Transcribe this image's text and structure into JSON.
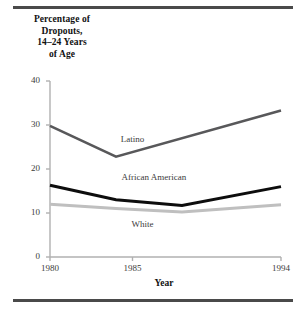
{
  "figure": {
    "title": "Percentage of Dropouts, 14–24 Years of Age",
    "title_lines": [
      "Percentage of",
      "Dropouts,",
      "14–24 Years",
      "of Age"
    ],
    "xaxis_title": "Year"
  },
  "chart_data": {
    "type": "line",
    "title": "Percentage of Dropouts, 14–24 Years of Age",
    "xlabel": "Year",
    "ylabel": "Percentage of Dropouts, 14-24 Years of Age",
    "xlim": [
      1980,
      1994
    ],
    "ylim": [
      0,
      40
    ],
    "xticks": [
      1980,
      1985,
      1994
    ],
    "xtick_labels": [
      "1980",
      "1985",
      "1994"
    ],
    "yticks": [
      0,
      10,
      20,
      30,
      40
    ],
    "ytick_labels": [
      "0",
      "10",
      "20",
      "30",
      "40"
    ],
    "grid": false,
    "legend": "inline-labels",
    "series": [
      {
        "name": "Latino",
        "color": "#58585a",
        "label_x": 1985.0,
        "label_y": 26.5,
        "x": [
          1980,
          1984,
          1994
        ],
        "values": [
          29.8,
          22.8,
          33.3
        ]
      },
      {
        "name": "African American",
        "color": "#0d0d0d",
        "label_x": 1986.3,
        "label_y": 18.0,
        "x": [
          1980,
          1984,
          1988,
          1994
        ],
        "values": [
          16.3,
          13.0,
          11.7,
          16.0
        ]
      },
      {
        "name": "White",
        "color": "#bfbfbf",
        "label_x": 1985.6,
        "label_y": 7.2,
        "x": [
          1980,
          1984,
          1988,
          1994
        ],
        "values": [
          12.0,
          11.0,
          10.2,
          11.9
        ]
      }
    ]
  },
  "axis": {
    "y_labels": [
      "40",
      "30",
      "20",
      "10",
      "0"
    ],
    "x_labels": [
      "1980",
      "1985",
      "1994"
    ]
  },
  "colors": {
    "rule": "#4a4a4a",
    "axis": "#b0b0b0",
    "text": "#3b3b3b",
    "latino": "#58585a",
    "african_american": "#0d0d0d",
    "white_series": "#bfbfbf"
  }
}
